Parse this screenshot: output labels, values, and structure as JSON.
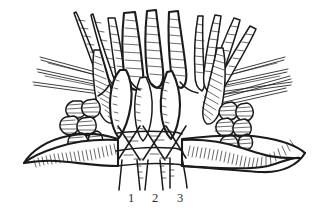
{
  "figure": {
    "domain_type": "scientific-line-drawing",
    "medium": "ink line drawing, black on white",
    "background_color": "#ffffff",
    "ink_color": "#1b1b1b",
    "width_px": 323,
    "height_px": 221
  },
  "labels": [
    {
      "id": "1",
      "text": "1",
      "x": 131,
      "y": 198
    },
    {
      "id": "2",
      "text": "2",
      "x": 155,
      "y": 198
    },
    {
      "id": "3",
      "text": "3",
      "x": 180,
      "y": 198
    }
  ],
  "parts": {
    "papillae_label": "digitiform papillae row",
    "left_lobe_cluster_label": "left lobed cluster",
    "right_lobe_cluster_label": "right lobed cluster",
    "left_process_label": "left curved lateral process",
    "right_process_label": "right curved lateral process",
    "left_bristles_label": "left radiating bristles",
    "right_bristles_label": "right radiating bristles",
    "median_lobe_left_label": "left median leaf lobe",
    "median_lobe_center_label": "central median lobe",
    "median_lobe_right_label": "right median leaf lobe",
    "transverse_band_upper_label": "upper transverse band",
    "transverse_band_lower_label": "lower transverse band",
    "crossing_strands_label": "crossing median strands"
  }
}
